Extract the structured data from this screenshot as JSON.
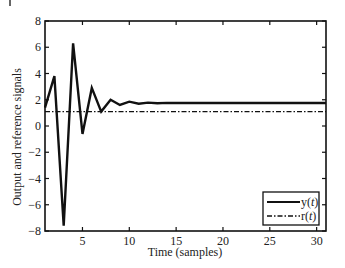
{
  "chart_data": {
    "type": "line",
    "title": "",
    "xlabel": "Time (samples)",
    "ylabel": "Output and reference signals",
    "xlim": [
      1,
      31
    ],
    "ylim": [
      -8,
      8
    ],
    "xticks": [
      5,
      10,
      15,
      20,
      25,
      30
    ],
    "yticks": [
      -8,
      -6,
      -4,
      -2,
      0,
      2,
      4,
      6,
      8
    ],
    "grid": false,
    "legend_position": "lower right",
    "x": [
      1,
      2,
      3,
      4,
      5,
      6,
      7,
      8,
      9,
      10,
      11,
      12,
      13,
      14,
      15,
      16,
      17,
      18,
      19,
      20,
      21,
      22,
      23,
      24,
      25,
      26,
      27,
      28,
      29,
      30,
      31
    ],
    "series": [
      {
        "name": "y(t)",
        "style": "solid",
        "values": [
          1.4,
          3.8,
          -7.6,
          6.3,
          -0.6,
          2.9,
          1.1,
          2.0,
          1.6,
          1.85,
          1.7,
          1.78,
          1.73,
          1.76,
          1.75,
          1.75,
          1.75,
          1.75,
          1.75,
          1.75,
          1.75,
          1.75,
          1.75,
          1.75,
          1.75,
          1.75,
          1.75,
          1.75,
          1.75,
          1.75,
          1.75
        ]
      },
      {
        "name": "r(t)",
        "style": "dash-dot",
        "values": [
          1.1,
          1.1,
          1.1,
          1.1,
          1.1,
          1.1,
          1.1,
          1.1,
          1.1,
          1.1,
          1.1,
          1.1,
          1.1,
          1.1,
          1.1,
          1.1,
          1.1,
          1.1,
          1.1,
          1.1,
          1.1,
          1.1,
          1.1,
          1.1,
          1.1,
          1.1,
          1.1,
          1.1,
          1.1,
          1.1,
          1.1
        ]
      }
    ]
  },
  "legend": {
    "entries": [
      {
        "label_main": "y(",
        "label_var": "t",
        "label_end": ")"
      },
      {
        "label_main": "r(",
        "label_var": "t",
        "label_end": ")"
      }
    ]
  },
  "colors": {
    "line": "#111111",
    "axis": "#111111"
  }
}
